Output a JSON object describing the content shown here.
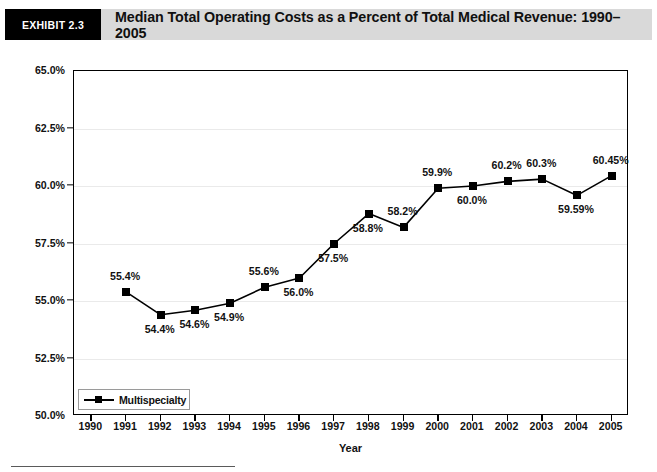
{
  "header": {
    "exhibit_tag": "EXHIBIT 2.3",
    "title": "Median Total Operating Costs as a Percent of Total Medical Revenue: 1990–2005"
  },
  "chart_data": {
    "type": "line",
    "title": "Median Total Operating Costs as a Percent of Total Medical Revenue: 1990–2005",
    "xlabel": "Year",
    "ylabel": "",
    "categories": [
      "1990",
      "1991",
      "1992",
      "1993",
      "1994",
      "1995",
      "1996",
      "1997",
      "1998",
      "1999",
      "2000",
      "2001",
      "2002",
      "2003",
      "2004",
      "2005"
    ],
    "x_tick_labels": [
      "1990",
      "1991",
      "1992",
      "1993",
      "1994",
      "1995",
      "1996",
      "1997",
      "1998",
      "1999",
      "2000",
      "2001",
      "2002",
      "2003",
      "2004",
      "2005"
    ],
    "y_tick_labels": [
      "65.0%",
      "62.5%",
      "60.0%",
      "57.5%",
      "55.0%",
      "52.5%",
      "50.0%"
    ],
    "y_tick_values": [
      65.0,
      62.5,
      60.0,
      57.5,
      55.0,
      52.5,
      50.0
    ],
    "ylim": [
      50.0,
      65.0
    ],
    "grid": true,
    "legend_position": "bottom-left",
    "series": [
      {
        "name": "Multispecialty",
        "color": "#000000",
        "marker": "square",
        "points": [
          {
            "x": "1990",
            "value": null,
            "label": ""
          },
          {
            "x": "1991",
            "value": 55.4,
            "label": "55.4%",
            "label_pos": "above"
          },
          {
            "x": "1992",
            "value": 54.4,
            "label": "54.4%",
            "label_pos": "below"
          },
          {
            "x": "1993",
            "value": 54.6,
            "label": "54.6%",
            "label_pos": "below"
          },
          {
            "x": "1994",
            "value": 54.9,
            "label": "54.9%",
            "label_pos": "below"
          },
          {
            "x": "1995",
            "value": 55.6,
            "label": "55.6%",
            "label_pos": "above"
          },
          {
            "x": "1996",
            "value": 56.0,
            "label": "56.0%",
            "label_pos": "below"
          },
          {
            "x": "1997",
            "value": 57.5,
            "label": "57.5%",
            "label_pos": "below"
          },
          {
            "x": "1998",
            "value": 58.8,
            "label": "58.8%",
            "label_pos": "below"
          },
          {
            "x": "1999",
            "value": 58.2,
            "label": "58.2%",
            "label_pos": "above"
          },
          {
            "x": "2000",
            "value": 59.9,
            "label": "59.9%",
            "label_pos": "above"
          },
          {
            "x": "2001",
            "value": 60.0,
            "label": "60.0%",
            "label_pos": "below"
          },
          {
            "x": "2002",
            "value": 60.2,
            "label": "60.2%",
            "label_pos": "above"
          },
          {
            "x": "2003",
            "value": 60.3,
            "label": "60.3%",
            "label_pos": "above"
          },
          {
            "x": "2004",
            "value": 59.59,
            "label": "59.59%",
            "label_pos": "below"
          },
          {
            "x": "2005",
            "value": 60.45,
            "label": "60.45%",
            "label_pos": "above"
          }
        ]
      }
    ]
  },
  "legend": {
    "items": [
      {
        "label": "Multispecialty",
        "color": "#000000"
      }
    ]
  }
}
